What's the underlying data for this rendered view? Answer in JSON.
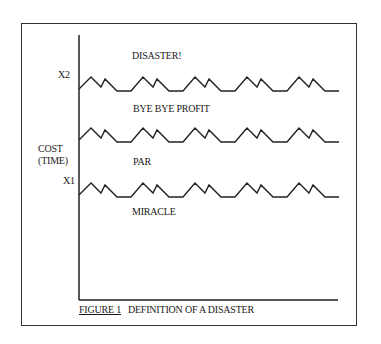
{
  "figure": {
    "caption_number": "FIGURE 1",
    "caption_text": "DEFINITION OF A DISASTER"
  },
  "y_axis": {
    "label_line1": "COST",
    "label_line2": "(TIME)",
    "ticks": [
      "X2",
      "X1"
    ]
  },
  "regions": {
    "top": "DISASTER!",
    "upper_middle": "BYE BYE PROFIT",
    "lower_middle": "PAR",
    "bottom": "MIRACLE"
  },
  "lines": [
    {
      "name": "x2-threshold",
      "y": 89
    },
    {
      "name": "par-line",
      "y": 140
    },
    {
      "name": "x1-threshold",
      "y": 195
    }
  ]
}
